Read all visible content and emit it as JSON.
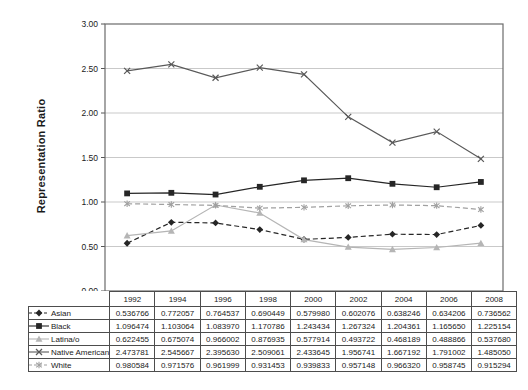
{
  "chart_data": {
    "type": "line",
    "title": "",
    "xlabel": "",
    "ylabel": "Representation Ratio",
    "ylim": [
      0,
      3
    ],
    "ytick_labels": [
      "3.00",
      "2.50",
      "2.00",
      "1.50",
      "1.00",
      "0.50",
      "0.00"
    ],
    "grid": true,
    "legend_position": "left-of-data-table",
    "categories": [
      "1992",
      "1994",
      "1996",
      "1998",
      "2000",
      "2002",
      "2004",
      "2006",
      "2008"
    ],
    "series": [
      {
        "name": "Asian",
        "marker": "diamond",
        "line_style": "dashed",
        "color": "#262626",
        "values": [
          "0.536766",
          "0.772057",
          "0.764537",
          "0.690449",
          "0.579980",
          "0.602076",
          "0.638246",
          "0.634206",
          "0.736562"
        ]
      },
      {
        "name": "Black",
        "marker": "square",
        "line_style": "solid",
        "color": "#262626",
        "values": [
          "1.096474",
          "1.103064",
          "1.083970",
          "1.170786",
          "1.243434",
          "1.267324",
          "1.204361",
          "1.165650",
          "1.225154"
        ]
      },
      {
        "name": "Latina/o",
        "marker": "triangle",
        "line_style": "solid",
        "color": "#b5b5b5",
        "values": [
          "0.622455",
          "0.675074",
          "0.966002",
          "0.876935",
          "0.577914",
          "0.493722",
          "0.468189",
          "0.488866",
          "0.537680"
        ]
      },
      {
        "name": "Native American",
        "marker": "x",
        "line_style": "solid",
        "color": "#595959",
        "values": [
          "2.473781",
          "2.545667",
          "2.395630",
          "2.509061",
          "2.433645",
          "1.956741",
          "1.667192",
          "1.791002",
          "1.485050"
        ]
      },
      {
        "name": "White",
        "marker": "asterisk",
        "line_style": "dashed",
        "color": "#a0a0a0",
        "values": [
          "0.980584",
          "0.971576",
          "0.961999",
          "0.931453",
          "0.939833",
          "0.957148",
          "0.966320",
          "0.958745",
          "0.915294"
        ]
      }
    ],
    "style_colors": {
      "gridline": "#c9c9c9",
      "plot_border": "#6b6b6b",
      "axis_tick": "#555555",
      "table_border": "#4d4d4d",
      "text": "#1a1a1a"
    }
  }
}
